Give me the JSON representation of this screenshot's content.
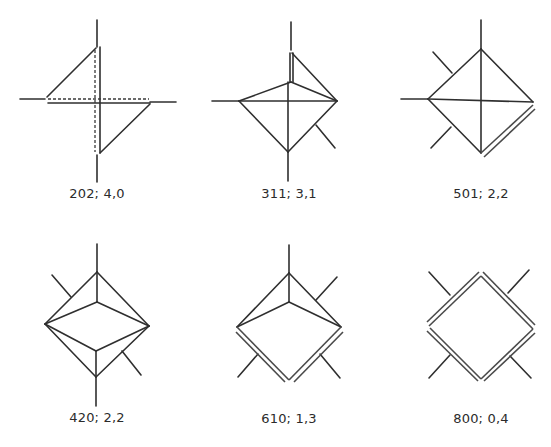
{
  "figures": [
    {
      "id": "202",
      "label": "202; 4,0",
      "row": 1,
      "col": 1
    },
    {
      "id": "311",
      "label": "311; 3,1",
      "row": 1,
      "col": 2
    },
    {
      "id": "501",
      "label": "501; 2,2",
      "row": 1,
      "col": 3
    },
    {
      "id": "420",
      "label": "420; 2,2",
      "row": 2,
      "col": 1
    },
    {
      "id": "610",
      "label": "610; 1,3",
      "row": 2,
      "col": 2
    },
    {
      "id": "800",
      "label": "800; 0,4",
      "row": 2,
      "col": 3
    }
  ],
  "colors": {
    "line": "#2f2f2f",
    "background": "#ffffff"
  }
}
